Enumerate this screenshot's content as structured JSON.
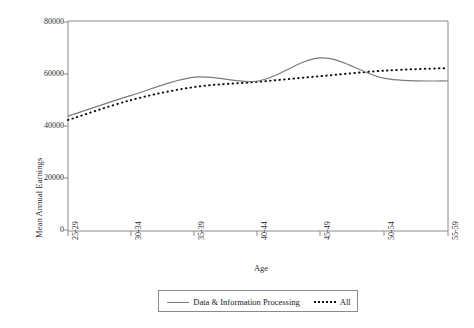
{
  "chart_data": {
    "type": "line",
    "title": "",
    "xlabel": "Age",
    "ylabel": "Mean Annual Earnings",
    "categories": [
      "25-29",
      "30-34",
      "35-39",
      "40-44",
      "45-49",
      "50-54",
      "55-59"
    ],
    "ylim": [
      0,
      80000
    ],
    "yticks": [
      0,
      20000,
      40000,
      60000,
      80000
    ],
    "ytick_labels": [
      "0",
      "20000",
      "40000",
      "60000",
      "80000"
    ],
    "grid": false,
    "legend_position": "bottom",
    "series": [
      {
        "name": "Data & Information Processing",
        "style": "solid",
        "color": "#7b7b7b",
        "values": [
          43800,
          51800,
          58800,
          57300,
          66200,
          58300,
          57300
        ]
      },
      {
        "name": "All",
        "style": "dotted",
        "color": "#111111",
        "values": [
          42300,
          50000,
          55000,
          57000,
          59200,
          61300,
          62300
        ]
      }
    ]
  },
  "axes": {
    "y_title": "Mean Annual Earnings",
    "x_title": "Age",
    "y_labels": [
      "80000",
      "60000",
      "40000",
      "20000",
      "0"
    ],
    "x_labels": [
      "25-29",
      "30-34",
      "35-39",
      "40-44",
      "45-49",
      "50-54",
      "55-59"
    ]
  },
  "legend": {
    "items": [
      {
        "label": "Data & Information Processing",
        "marker": "solid-line-swatch"
      },
      {
        "label": "All",
        "marker": "dotted-line-swatch"
      }
    ]
  },
  "colors": {
    "series_solid": "#7b7b7b",
    "series_dotted": "#111111",
    "axis": "#8a8a8a",
    "text": "#1a1a1a",
    "background": "#ffffff"
  }
}
